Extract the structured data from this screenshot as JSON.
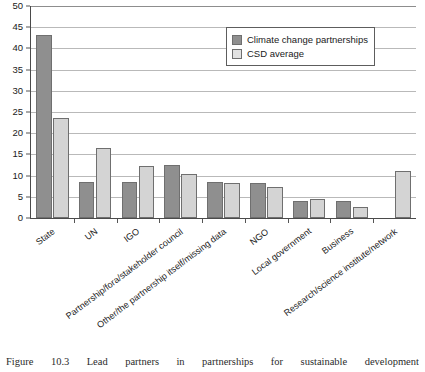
{
  "chart_data": {
    "type": "bar",
    "title": "",
    "xlabel": "",
    "ylabel": "",
    "ylim": [
      0,
      50
    ],
    "yticks": [
      0,
      5,
      10,
      15,
      20,
      25,
      30,
      35,
      40,
      45,
      50
    ],
    "grid": true,
    "legend_position": "top-right",
    "categories": [
      "State",
      "UN",
      "IGO",
      "Partnership/fora/stakeholder council",
      "Other/the partnership itself/missing data",
      "NGO",
      "Local government",
      "Business",
      "Research/science institute/network"
    ],
    "series": [
      {
        "name": "Climate change partnerships",
        "color": "#8f8f8f",
        "values": [
          43.2,
          8.5,
          8.5,
          12.5,
          8.4,
          8.3,
          4.0,
          3.9,
          0
        ]
      },
      {
        "name": "CSD average",
        "color": "#d4d4d4",
        "values": [
          23.6,
          16.5,
          12.2,
          10.4,
          8.3,
          7.2,
          4.5,
          2.7,
          11.0
        ]
      }
    ]
  },
  "legend": {
    "entries": [
      {
        "label": "Climate change partnerships"
      },
      {
        "label": "CSD average"
      }
    ]
  },
  "caption": {
    "words": [
      "Figure",
      "10.3",
      "Lead",
      "partners",
      "in",
      "partnerships",
      "for",
      "sustainable",
      "development"
    ]
  },
  "colors": {
    "series1": "#8f8f8f",
    "series2": "#d4d4d4",
    "axis": "#4a4a4a",
    "grid": "#b9b9b9",
    "text": "#1a1a1a",
    "background": "#ffffff"
  }
}
